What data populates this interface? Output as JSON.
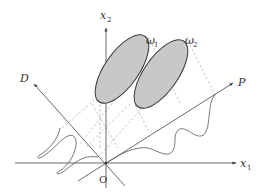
{
  "figure": {
    "axes": {
      "x1_label": "x",
      "x1_sub": "1",
      "x2_label": "x",
      "x2_sub": "2",
      "origin_label": "O"
    },
    "projection_axes": {
      "p_label": "P",
      "d_label": "D"
    },
    "classes": [
      {
        "label": "ω",
        "sub": "1"
      },
      {
        "label": "ω",
        "sub": "2"
      }
    ],
    "colors": {
      "ellipse_fill": "#c8c8c8",
      "ellipse_stroke": "#333333",
      "axis": "#444444",
      "dashed": "#aaaaaa",
      "curve": "#555555"
    }
  }
}
